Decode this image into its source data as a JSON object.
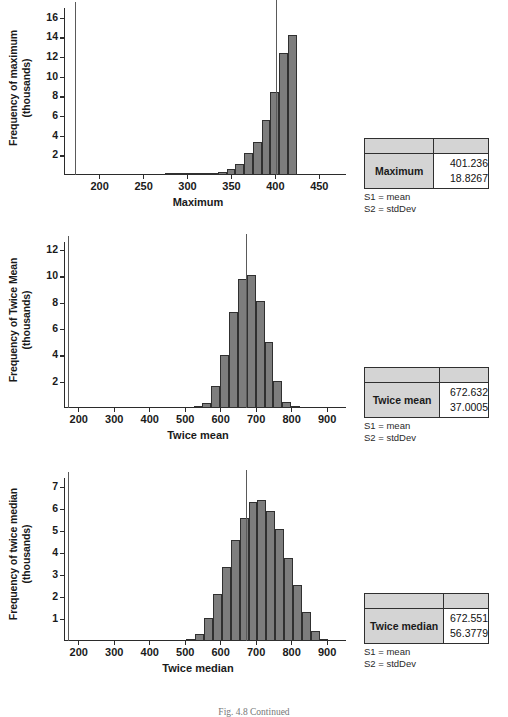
{
  "figure": {
    "caption": "Fig. 4.8  Continued",
    "legend_lines": [
      "S1 = mean",
      "S2 = stdDev"
    ],
    "bar_color": "#7d7d7d",
    "bar_edge_color": "#303030",
    "axis_color": "#2b2b2b",
    "table_header_fill": "#d4d4d4"
  },
  "panels": [
    {
      "id": "maximum",
      "chart_data": {
        "type": "bar",
        "title": "",
        "xlabel": "Maximum",
        "ylabel": "Frequency of maximum (thousands)",
        "xlim": [
          160,
          465
        ],
        "ylim": [
          0,
          17
        ],
        "xticks": [
          200,
          250,
          300,
          350,
          400,
          450
        ],
        "yticks": [
          2,
          4,
          6,
          8,
          10,
          12,
          14,
          16
        ],
        "grid": false,
        "legend": "none",
        "bin_width": 10,
        "bin_starts": [
          275,
          285,
          295,
          305,
          315,
          325,
          335,
          345,
          355,
          365,
          375,
          385,
          395,
          405,
          415
        ],
        "categories": [
          "275",
          "285",
          "295",
          "305",
          "315",
          "325",
          "335",
          "345",
          "355",
          "365",
          "375",
          "385",
          "395",
          "405",
          "415"
        ],
        "values": [
          0.05,
          0.05,
          0.05,
          0.05,
          0.08,
          0.15,
          0.35,
          0.65,
          1.1,
          2.2,
          3.35,
          5.6,
          8.5,
          12.45,
          14.25
        ],
        "reference_lines": [
          172,
          401.236
        ],
        "annotations": [
          "vertical reference line at x=172",
          "vertical reference line at mean x=401.236"
        ]
      },
      "table": {
        "header": [
          "",
          ""
        ],
        "row_label": "Maximum",
        "values": [
          "401.236",
          "18.8267"
        ],
        "value_meanings": [
          "S1 = mean",
          "S2 = stdDev"
        ]
      }
    },
    {
      "id": "twice-mean",
      "chart_data": {
        "type": "bar",
        "title": "",
        "xlabel": "Twice mean",
        "ylabel": "Frequency of Twice Mean (thousands)",
        "xlim": [
          160,
          915
        ],
        "ylim": [
          0,
          12.6
        ],
        "xticks": [
          200,
          300,
          400,
          500,
          600,
          700,
          800,
          900
        ],
        "yticks": [
          2,
          4,
          6,
          8,
          10,
          12
        ],
        "grid": false,
        "legend": "none",
        "bin_width": 25,
        "bin_starts": [
          525,
          550,
          575,
          600,
          625,
          650,
          675,
          700,
          725,
          750,
          775,
          800
        ],
        "categories": [
          "525",
          "550",
          "575",
          "600",
          "625",
          "650",
          "675",
          "700",
          "725",
          "750",
          "775",
          "800"
        ],
        "values": [
          0.06,
          0.4,
          1.65,
          4.0,
          7.3,
          9.8,
          10.1,
          8.1,
          5.0,
          2.05,
          0.45,
          0.07
        ],
        "reference_lines": [
          172,
          672.632
        ],
        "annotations": [
          "vertical reference line at x=172",
          "vertical reference line at mean x=672.632"
        ]
      },
      "table": {
        "header": [
          "",
          ""
        ],
        "row_label": "Twice mean",
        "values": [
          "672.632",
          "37.0005"
        ],
        "value_meanings": [
          "S1 = mean",
          "S2 = stdDev"
        ]
      }
    },
    {
      "id": "twice-median",
      "chart_data": {
        "type": "bar",
        "title": "",
        "xlabel": "Twice median",
        "ylabel": "Frequency of twice median (thousands)",
        "xlim": [
          160,
          915
        ],
        "ylim": [
          0,
          7.4
        ],
        "xticks": [
          200,
          300,
          400,
          500,
          600,
          700,
          800,
          900
        ],
        "yticks": [
          1,
          2,
          3,
          4,
          5,
          6,
          7
        ],
        "grid": false,
        "legend": "none",
        "bin_width": 25,
        "bin_starts": [
          505,
          530,
          555,
          580,
          605,
          630,
          655,
          680,
          705,
          730,
          755,
          780,
          805,
          830
        ],
        "categories": [
          "505",
          "530",
          "555",
          "580",
          "605",
          "630",
          "655",
          "680",
          "705",
          "730",
          "755",
          "780",
          "805",
          "830"
        ],
        "values": [
          0.05,
          0.3,
          1.05,
          2.12,
          3.38,
          4.6,
          5.6,
          6.32,
          6.38,
          5.88,
          5.07,
          3.78,
          2.55,
          1.3
        ],
        "values_tail": [
          0.45,
          0.1
        ],
        "reference_lines": [
          172,
          672.551
        ],
        "annotations": [
          "vertical reference line at x=172",
          "vertical reference line at mean x=672.551"
        ]
      },
      "table": {
        "header": [
          "",
          ""
        ],
        "row_label": "Twice median",
        "values": [
          "672.551",
          "56.3779"
        ],
        "value_meanings": [
          "S1 = mean",
          "S2 = stdDev"
        ]
      }
    }
  ]
}
